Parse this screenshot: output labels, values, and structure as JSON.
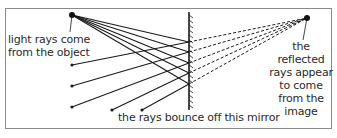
{
  "diagram": {
    "labels": {
      "object": "light rays come from the object",
      "object_line1": "light rays come",
      "object_line2": "from the object",
      "image_line1": "the reflected",
      "image_line2": "rays appear",
      "image_line3": "to come",
      "image_line4": "from the",
      "image_line5": "image",
      "mirror": "the rays bounce off this mirror"
    },
    "colors": {
      "ray": "#1a1a1a",
      "frame": "#8a8a8a",
      "text": "#2a2a2a"
    },
    "object_point": {
      "x": 72,
      "y": 15
    },
    "image_point": {
      "x": 307,
      "y": 18
    },
    "mirror": {
      "x": 189,
      "y_top": 12,
      "y_bottom": 110
    },
    "rays": [
      {
        "hit_y": 42,
        "end": {
          "x": 72,
          "y": 65
        }
      },
      {
        "hit_y": 52,
        "end": {
          "x": 72,
          "y": 86
        }
      },
      {
        "hit_y": 63,
        "end": {
          "x": 72,
          "y": 107
        }
      },
      {
        "hit_y": 73,
        "end": {
          "x": 112,
          "y": 110
        }
      },
      {
        "hit_y": 84,
        "end": {
          "x": 142,
          "y": 110
        }
      }
    ]
  }
}
